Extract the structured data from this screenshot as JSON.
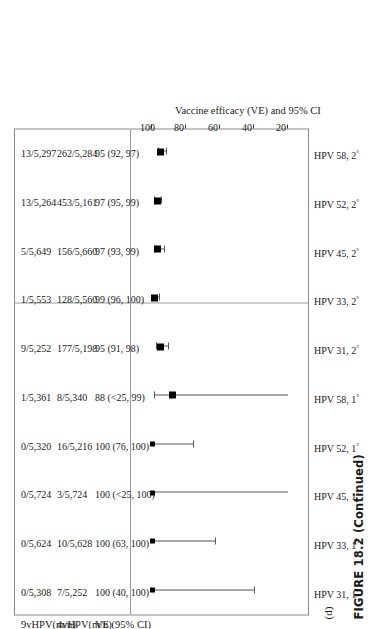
{
  "figure": {
    "caption": "FIGURE 18.2 (Continued)",
    "panel_letter": "(d)"
  },
  "table": {
    "headers": {
      "col9v": "9vHPV(m/n)",
      "col4v": "4vHPV(m/n)",
      "colve": "VE (95% CI)"
    }
  },
  "chart_data": {
    "type": "scatter",
    "title": "",
    "xlabel": "Vaccine efficacy (VE) and 95% CI",
    "ylabel": "",
    "xlim": [
      20,
      105
    ],
    "xticks": [
      20,
      40,
      60,
      80,
      100
    ],
    "xticklabels": [
      "20",
      "40",
      "60",
      "80",
      "100"
    ],
    "grid": false,
    "legend": null,
    "orientation": "rotated-90-ccw",
    "note": "Forest plot of vaccine efficacy point estimates with 95% confidence intervals; lower bounds shown as <25 are clipped at the axis minimum.",
    "categories": [
      "HPV 31, 1°",
      "HPV 33, 1°",
      "HPV 45, 1°",
      "HPV 52, 1°",
      "HPV 58, 1°",
      "HPV 31, 2°",
      "HPV 33, 2°",
      "HPV 45, 2°",
      "HPV 52, 2°",
      "HPV 58, 2°"
    ],
    "rows": [
      {
        "label": "HPV 31, 1°",
        "label_base": "HPV 31, 1",
        "label_sup": "°",
        "n9v": "0/5,308",
        "n4v": "7/5,252",
        "ve_text": "100 (40, 100)",
        "ve": 100,
        "ci_low": 40,
        "ci_high": 100,
        "ci_low_clipped": false
      },
      {
        "label": "HPV 33, 1°",
        "label_base": "HPV 33, 1",
        "label_sup": "°",
        "n9v": "0/5,624",
        "n4v": "10/5,628",
        "ve_text": "100 (63, 100)",
        "ve": 100,
        "ci_low": 63,
        "ci_high": 100,
        "ci_low_clipped": false
      },
      {
        "label": "HPV 45, 1°",
        "label_base": "HPV 45, 1",
        "label_sup": "°",
        "n9v": "0/5,724",
        "n4v": "3/5,724",
        "ve_text": "100 (<25, 100)",
        "ve": 100,
        "ci_low": 20,
        "ci_high": 100,
        "ci_low_clipped": true
      },
      {
        "label": "HPV 52, 1°",
        "label_base": "HPV 52, 1",
        "label_sup": "°",
        "n9v": "0/5,320",
        "n4v": "16/5,216",
        "ve_text": "100 (76, 100)",
        "ve": 100,
        "ci_low": 76,
        "ci_high": 100,
        "ci_low_clipped": false
      },
      {
        "label": "HPV 58, 1°",
        "label_base": "HPV 58, 1",
        "label_sup": "°",
        "n9v": "1/5,361",
        "n4v": "8/5,340",
        "ve_text": "88 (<25, 99)",
        "ve": 88,
        "ci_low": 20,
        "ci_high": 99,
        "ci_low_clipped": true
      },
      {
        "label": "HPV 31, 2°",
        "label_base": "HPV 31, 2",
        "label_sup": "°",
        "n9v": "9/5,252",
        "n4v": "177/5,198",
        "ve_text": "95 (91, 98)",
        "ve": 95,
        "ci_low": 91,
        "ci_high": 98,
        "ci_low_clipped": false
      },
      {
        "label": "HPV 33, 2°",
        "label_base": "HPV 33, 2",
        "label_sup": "°",
        "n9v": "1/5,553",
        "n4v": "128/5,560",
        "ve_text": "99 (96, 100)",
        "ve": 99,
        "ci_low": 96,
        "ci_high": 100,
        "ci_low_clipped": false
      },
      {
        "label": "HPV 45, 2°",
        "label_base": "HPV 45, 2",
        "label_sup": "°",
        "n9v": "5/5,649",
        "n4v": "156/5,660",
        "ve_text": "97 (93, 99)",
        "ve": 97,
        "ci_low": 93,
        "ci_high": 99,
        "ci_low_clipped": false
      },
      {
        "label": "HPV 52, 2°",
        "label_base": "HPV 52, 2",
        "label_sup": "°",
        "n9v": "13/5,264",
        "n4v": "453/5,161",
        "ve_text": "97 (95, 99)",
        "ve": 97,
        "ci_low": 95,
        "ci_high": 99,
        "ci_low_clipped": false
      },
      {
        "label": "HPV 58, 2°",
        "label_base": "HPV 58, 2",
        "label_sup": "°",
        "n9v": "13/5,297",
        "n4v": "262/5,284",
        "ve_text": "95 (92, 97)",
        "ve": 95,
        "ci_low": 92,
        "ci_high": 97,
        "ci_low_clipped": false
      }
    ]
  }
}
